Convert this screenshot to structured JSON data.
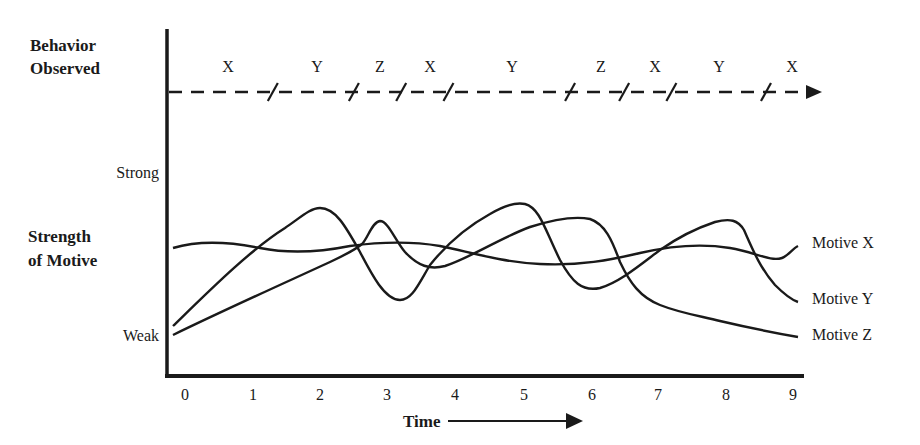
{
  "chart_data": {
    "type": "line",
    "title": "",
    "xlabel": "Time",
    "ylabel": "Strength of Motive",
    "x": [
      0,
      1,
      2,
      3,
      4,
      5,
      6,
      7,
      8,
      9
    ],
    "x_tick_labels": [
      "0",
      "1",
      "2",
      "3",
      "4",
      "5",
      "6",
      "7",
      "8",
      "9"
    ],
    "y_tick_labels": {
      "high": "Strong",
      "low": "Weak"
    },
    "ylim": [
      0,
      10
    ],
    "xlim": [
      0,
      9
    ],
    "grid": false,
    "legend_position": "right (inline labels at line ends)",
    "series": [
      {
        "name": "Motive X",
        "values": [
          5.4,
          5.8,
          5.5,
          5.9,
          5.1,
          4.4,
          4.6,
          5.6,
          5.2,
          5.6
        ]
      },
      {
        "name": "Motive Y",
        "values": [
          0.6,
          4.8,
          7.8,
          2.5,
          5.3,
          8.1,
          3.0,
          4.9,
          7.0,
          2.2
        ]
      },
      {
        "name": "Motive Z",
        "values": [
          0.1,
          2.6,
          4.5,
          7.0,
          4.5,
          6.2,
          7.1,
          3.2,
          1.9,
          0.1
        ]
      }
    ],
    "behavior_observed": {
      "label_line1": "Behavior",
      "label_line2": "Observed",
      "segments": [
        {
          "behavior": "X",
          "x_start": 0,
          "x_end": 1.3
        },
        {
          "behavior": "Y",
          "x_start": 1.3,
          "x_end": 2.5
        },
        {
          "behavior": "Z",
          "x_start": 2.5,
          "x_end": 3.2
        },
        {
          "behavior": "X",
          "x_start": 3.2,
          "x_end": 3.9
        },
        {
          "behavior": "Y",
          "x_start": 3.9,
          "x_end": 5.7
        },
        {
          "behavior": "Z",
          "x_start": 5.7,
          "x_end": 6.5
        },
        {
          "behavior": "X",
          "x_start": 6.5,
          "x_end": 7.2
        },
        {
          "behavior": "Y",
          "x_start": 7.2,
          "x_end": 8.6
        },
        {
          "behavior": "X",
          "x_start": 8.6,
          "x_end": 9.4
        }
      ]
    }
  },
  "labels": {
    "behavior_line1": "Behavior",
    "behavior_line2": "Observed",
    "strong": "Strong",
    "weak": "Weak",
    "strength_line1": "Strength",
    "strength_line2": "of Motive",
    "time": "Time",
    "motive_x": "Motive X",
    "motive_y": "Motive Y",
    "motive_z": "Motive Z",
    "ticks": [
      "0",
      "1",
      "2",
      "3",
      "4",
      "5",
      "6",
      "7",
      "8",
      "9"
    ],
    "behaviors": [
      "X",
      "Y",
      "Z",
      "X",
      "Y",
      "Z",
      "X",
      "Y",
      "X"
    ]
  },
  "colors": {
    "ink": "#1a1a1a",
    "background": "#ffffff"
  }
}
